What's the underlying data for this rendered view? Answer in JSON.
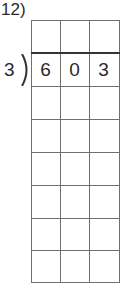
{
  "problem": {
    "number_label": "12)",
    "divisor": "3",
    "dividend_digits": [
      "6",
      "0",
      "3"
    ],
    "grid": {
      "columns": 3,
      "rows": 8
    }
  }
}
